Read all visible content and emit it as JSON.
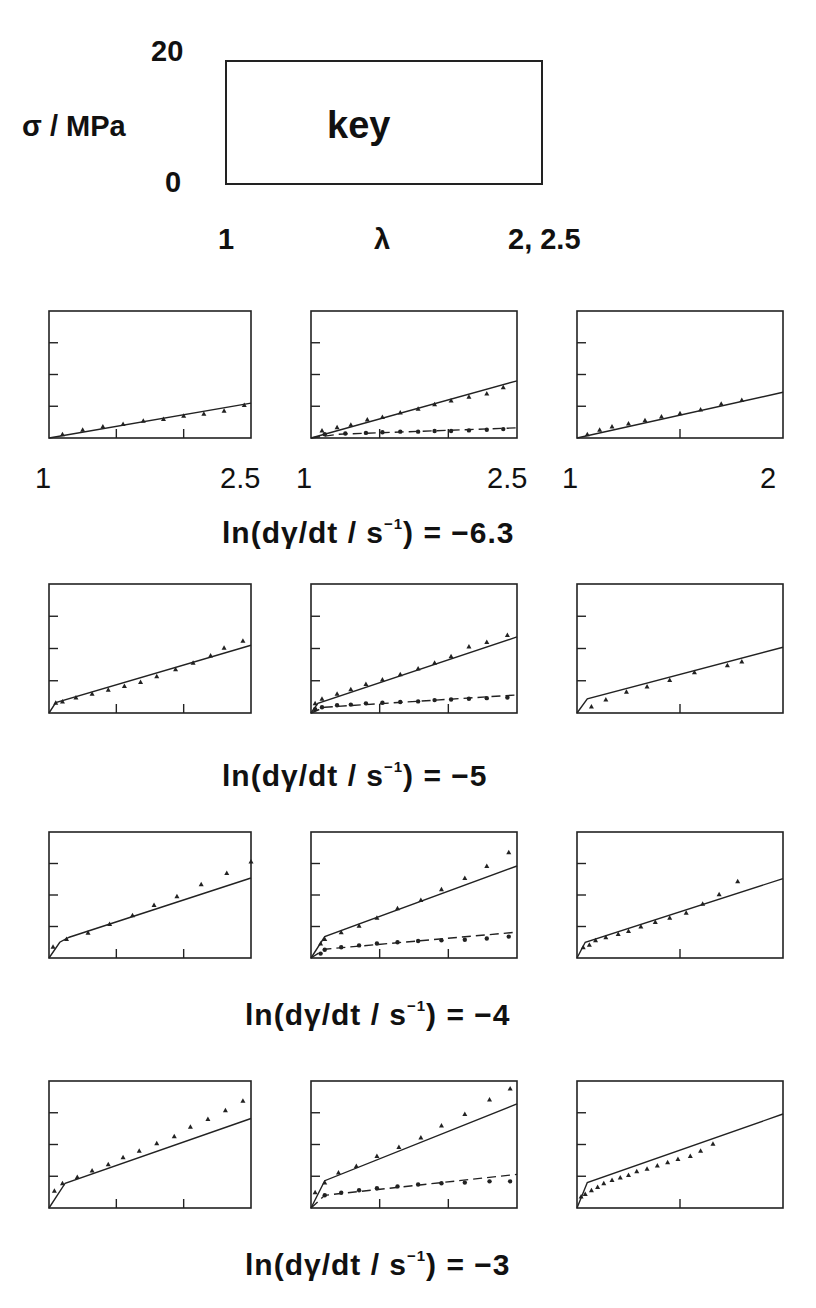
{
  "key": {
    "box_label": "key",
    "y_axis_label": "σ  /  MPa",
    "y_max_label": "20",
    "y_min_label": "0",
    "x_label": "λ",
    "x_min_label": "1",
    "x_max_label": "2,  2.5"
  },
  "column_x_labels": [
    {
      "min": "1",
      "max": "2.5"
    },
    {
      "min": "1",
      "max": "2.5"
    },
    {
      "min": "1",
      "max": "2"
    }
  ],
  "row_captions": [
    "ln(dγ/dt  /  s⁻¹)  =  −6.3",
    "ln(dγ/dt  /  s⁻¹)  =  −5",
    "ln(dγ/dt  /  s⁻¹)  =  −4",
    "ln(dγ/dt  /  s⁻¹)  =  −3"
  ],
  "caption_parts": {
    "prefix": "ln(dγ/dt  /  s",
    "sup": "−1",
    "mid": ")  =  ",
    "values": [
      "−6.3",
      "−5",
      "−4",
      "−3"
    ]
  },
  "chart_data": {
    "type": "scatter",
    "xlabel": "λ",
    "ylabel": "σ / MPa",
    "ylim": [
      0,
      20
    ],
    "y_ticks": [
      5,
      10,
      15
    ],
    "grid": false,
    "legend": "none (key panel defines axes)",
    "panels": [
      {
        "row": 0,
        "col": 0,
        "xlim": [
          1,
          2.5
        ],
        "x_ticks": [
          1.5,
          2.0
        ],
        "series": [
          {
            "name": "data (triangles)",
            "marker": "triangle",
            "x": [
              1.1,
              1.25,
              1.4,
              1.55,
              1.7,
              1.85,
              2.0,
              2.15,
              2.3,
              2.45
            ],
            "y": [
              0.6,
              1.3,
              1.8,
              2.2,
              2.7,
              3.0,
              3.5,
              3.8,
              4.3,
              5.2
            ]
          },
          {
            "name": "model (solid)",
            "style": "solid",
            "x": [
              1.0,
              2.5
            ],
            "y": [
              0.0,
              5.5
            ]
          }
        ]
      },
      {
        "row": 0,
        "col": 1,
        "xlim": [
          1,
          2.5
        ],
        "x_ticks": [
          1.5,
          2.0
        ],
        "series": [
          {
            "name": "data (triangles)",
            "marker": "triangle",
            "x": [
              1.08,
              1.19,
              1.29,
              1.41,
              1.52,
              1.65,
              1.78,
              1.9,
              2.02,
              2.15,
              2.28,
              2.4
            ],
            "y": [
              1.2,
              1.7,
              2.1,
              2.9,
              3.3,
              4.0,
              4.6,
              5.3,
              5.9,
              6.5,
              7.0,
              8.0
            ]
          },
          {
            "name": "model (solid)",
            "style": "solid",
            "x": [
              1.0,
              2.5
            ],
            "y": [
              0.0,
              9.0
            ]
          },
          {
            "name": "data (circles)",
            "marker": "circle",
            "x": [
              1.1,
              1.25,
              1.4,
              1.52,
              1.65,
              1.78,
              1.9,
              2.02,
              2.15,
              2.28,
              2.4
            ],
            "y": [
              0.6,
              0.7,
              0.8,
              0.9,
              1.0,
              1.0,
              1.1,
              1.1,
              1.2,
              1.3,
              1.4
            ]
          },
          {
            "name": "model (dashed)",
            "style": "dashed",
            "x": [
              1.0,
              1.2,
              2.5
            ],
            "y": [
              0.0,
              0.6,
              1.6
            ]
          }
        ]
      },
      {
        "row": 0,
        "col": 2,
        "xlim": [
          1,
          2
        ],
        "x_ticks": [
          1.5
        ],
        "series": [
          {
            "name": "data (triangles)",
            "marker": "triangle",
            "x": [
              1.05,
              1.11,
              1.17,
              1.25,
              1.33,
              1.41,
              1.5,
              1.6,
              1.7,
              1.8
            ],
            "y": [
              0.6,
              1.3,
              1.8,
              2.3,
              2.8,
              3.4,
              3.9,
              4.5,
              5.4,
              6.0
            ]
          },
          {
            "name": "model (solid)",
            "style": "solid",
            "x": [
              1.0,
              2.0
            ],
            "y": [
              0.0,
              7.2
            ]
          }
        ]
      },
      {
        "row": 1,
        "col": 0,
        "xlim": [
          1,
          2.5
        ],
        "x_ticks": [
          1.5,
          2.0
        ],
        "series": [
          {
            "name": "data (triangles)",
            "marker": "triangle",
            "x": [
              1.05,
              1.1,
              1.2,
              1.32,
              1.44,
              1.56,
              1.68,
              1.8,
              1.94,
              2.07,
              2.2,
              2.3,
              2.44
            ],
            "y": [
              1.6,
              1.8,
              2.4,
              3.0,
              3.6,
              4.2,
              4.8,
              5.7,
              6.8,
              7.8,
              8.9,
              10.1,
              11.2
            ]
          },
          {
            "name": "model (solid)",
            "style": "solid",
            "x": [
              1.0,
              1.05,
              2.5
            ],
            "y": [
              0.0,
              1.6,
              10.5
            ]
          }
        ]
      },
      {
        "row": 1,
        "col": 1,
        "xlim": [
          1,
          2.5
        ],
        "x_ticks": [
          1.5,
          2.0
        ],
        "series": [
          {
            "name": "data (triangles)",
            "marker": "triangle",
            "x": [
              1.03,
              1.08,
              1.19,
              1.29,
              1.4,
              1.52,
              1.65,
              1.78,
              1.9,
              2.02,
              2.15,
              2.28,
              2.43
            ],
            "y": [
              1.5,
              2.2,
              3.0,
              3.7,
              4.5,
              5.2,
              6.0,
              6.9,
              7.8,
              8.8,
              10.3,
              11.0,
              12.1
            ]
          },
          {
            "name": "model (solid)",
            "style": "solid",
            "x": [
              1.0,
              1.05,
              2.5
            ],
            "y": [
              0.0,
              1.5,
              11.8
            ]
          },
          {
            "name": "data (circles)",
            "marker": "circle",
            "x": [
              1.03,
              1.08,
              1.19,
              1.29,
              1.4,
              1.52,
              1.65,
              1.78,
              1.9,
              2.02,
              2.15,
              2.28,
              2.43
            ],
            "y": [
              0.6,
              0.9,
              1.2,
              1.3,
              1.5,
              1.6,
              1.7,
              1.8,
              2.0,
              2.1,
              2.2,
              2.3,
              2.4
            ]
          },
          {
            "name": "model (dashed)",
            "style": "dashed",
            "x": [
              1.0,
              1.1,
              2.5
            ],
            "y": [
              0.0,
              0.9,
              2.8
            ]
          }
        ]
      },
      {
        "row": 1,
        "col": 2,
        "xlim": [
          1,
          2
        ],
        "x_ticks": [
          1.5
        ],
        "series": [
          {
            "name": "data (triangles)",
            "marker": "triangle",
            "x": [
              1.07,
              1.14,
              1.24,
              1.34,
              1.45,
              1.57,
              1.73,
              1.8
            ],
            "y": [
              1.0,
              2.1,
              3.3,
              4.1,
              5.1,
              6.3,
              7.4,
              8.0
            ]
          },
          {
            "name": "model (solid)",
            "style": "solid",
            "x": [
              1.0,
              1.05,
              2.0
            ],
            "y": [
              0.0,
              2.2,
              10.2
            ]
          }
        ]
      },
      {
        "row": 2,
        "col": 0,
        "xlim": [
          1,
          2.5
        ],
        "x_ticks": [
          1.5,
          2.0
        ],
        "series": [
          {
            "name": "data (triangles)",
            "marker": "triangle",
            "x": [
              1.03,
              1.13,
              1.29,
              1.45,
              1.62,
              1.78,
              1.95,
              2.13,
              2.32,
              2.5
            ],
            "y": [
              1.8,
              3.0,
              4.0,
              5.4,
              6.8,
              8.4,
              9.8,
              11.7,
              13.5,
              15.3
            ]
          },
          {
            "name": "model (solid)",
            "style": "solid",
            "x": [
              1.0,
              1.08,
              1.15,
              2.5
            ],
            "y": [
              0.0,
              2.5,
              3.3,
              12.7
            ]
          }
        ]
      },
      {
        "row": 2,
        "col": 1,
        "xlim": [
          1,
          2.5
        ],
        "x_ticks": [
          1.5,
          2.0
        ],
        "series": [
          {
            "name": "data (triangles)",
            "marker": "triangle",
            "x": [
              1.07,
              1.1,
              1.22,
              1.35,
              1.48,
              1.63,
              1.8,
              1.95,
              2.12,
              2.28,
              2.44
            ],
            "y": [
              2.3,
              3.0,
              4.1,
              5.1,
              6.4,
              7.9,
              9.2,
              10.9,
              12.7,
              14.6,
              16.8
            ]
          },
          {
            "name": "model (solid)",
            "style": "solid",
            "x": [
              1.0,
              1.1,
              2.5
            ],
            "y": [
              0.0,
              3.4,
              14.6
            ]
          },
          {
            "name": "data (circles)",
            "marker": "circle",
            "x": [
              1.07,
              1.1,
              1.22,
              1.35,
              1.48,
              1.63,
              1.78,
              1.95,
              2.12,
              2.28,
              2.44
            ],
            "y": [
              0.7,
              1.3,
              1.7,
              2.0,
              2.3,
              2.5,
              2.7,
              2.8,
              2.9,
              3.1,
              3.4
            ]
          },
          {
            "name": "model (dashed)",
            "style": "dashed",
            "x": [
              1.0,
              1.1,
              2.5
            ],
            "y": [
              0.0,
              1.4,
              4.1
            ]
          }
        ]
      },
      {
        "row": 2,
        "col": 2,
        "xlim": [
          1,
          2
        ],
        "x_ticks": [
          1.5
        ],
        "series": [
          {
            "name": "data (triangles)",
            "marker": "triangle",
            "x": [
              1.03,
              1.06,
              1.09,
              1.14,
              1.2,
              1.25,
              1.31,
              1.38,
              1.45,
              1.53,
              1.61,
              1.69,
              1.78
            ],
            "y": [
              1.7,
              2.1,
              2.8,
              3.3,
              3.8,
              4.3,
              5.0,
              5.7,
              6.4,
              7.2,
              8.6,
              10.1,
              12.2
            ]
          },
          {
            "name": "model (solid)",
            "style": "solid",
            "x": [
              1.0,
              1.04,
              2.0
            ],
            "y": [
              0.0,
              2.5,
              12.6
            ]
          }
        ]
      },
      {
        "row": 3,
        "col": 0,
        "xlim": [
          1,
          2.5
        ],
        "x_ticks": [
          1.5,
          2.0
        ],
        "series": [
          {
            "name": "data (triangles)",
            "marker": "triangle",
            "x": [
              1.04,
              1.1,
              1.21,
              1.32,
              1.44,
              1.55,
              1.67,
              1.8,
              1.93,
              2.05,
              2.18,
              2.31,
              2.44
            ],
            "y": [
              2.7,
              3.9,
              4.9,
              5.9,
              6.9,
              8.0,
              9.0,
              10.2,
              11.3,
              12.8,
              14.0,
              15.4,
              16.9
            ]
          },
          {
            "name": "model (solid)",
            "style": "solid",
            "x": [
              1.0,
              1.12,
              2.5
            ],
            "y": [
              0.0,
              3.9,
              14.1
            ]
          }
        ]
      },
      {
        "row": 3,
        "col": 1,
        "xlim": [
          1,
          2.5
        ],
        "x_ticks": [
          1.5,
          2.0
        ],
        "series": [
          {
            "name": "data (triangles)",
            "marker": "triangle",
            "x": [
              1.03,
              1.1,
              1.2,
              1.33,
              1.48,
              1.64,
              1.8,
              1.95,
              2.12,
              2.3,
              2.45
            ],
            "y": [
              2.5,
              4.0,
              5.6,
              6.6,
              8.2,
              9.6,
              11.1,
              13.0,
              14.8,
              17.1,
              18.8
            ]
          },
          {
            "name": "model (solid)",
            "style": "solid",
            "x": [
              1.0,
              1.1,
              2.5
            ],
            "y": [
              0.0,
              4.3,
              16.4
            ]
          },
          {
            "name": "data (circles)",
            "marker": "circle",
            "x": [
              1.1,
              1.22,
              1.35,
              1.48,
              1.63,
              1.78,
              1.95,
              2.12,
              2.3,
              2.45
            ],
            "y": [
              2.0,
              2.4,
              2.8,
              3.1,
              3.4,
              3.7,
              3.9,
              4.0,
              4.2,
              4.2
            ]
          },
          {
            "name": "model (dashed)",
            "style": "dashed",
            "x": [
              1.0,
              1.1,
              2.5
            ],
            "y": [
              0.0,
              2.0,
              5.3
            ]
          }
        ]
      },
      {
        "row": 3,
        "col": 2,
        "xlim": [
          1,
          2
        ],
        "x_ticks": [
          1.5
        ],
        "series": [
          {
            "name": "data (triangles)",
            "marker": "triangle",
            "x": [
              1.02,
              1.04,
              1.07,
              1.1,
              1.13,
              1.17,
              1.21,
              1.25,
              1.29,
              1.34,
              1.39,
              1.44,
              1.49,
              1.55,
              1.6,
              1.66
            ],
            "y": [
              1.8,
              2.2,
              2.8,
              3.3,
              3.9,
              4.4,
              4.8,
              5.2,
              5.8,
              6.2,
              6.7,
              7.2,
              7.7,
              8.2,
              9.0,
              10.1
            ]
          },
          {
            "name": "model (solid)",
            "style": "solid",
            "x": [
              1.0,
              1.05,
              2.0
            ],
            "y": [
              0.0,
              4.0,
              14.8
            ]
          }
        ]
      }
    ]
  }
}
